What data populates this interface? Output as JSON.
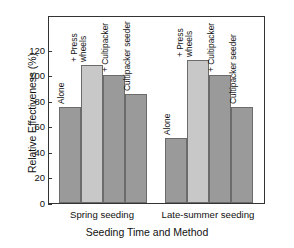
{
  "chart_data": {
    "type": "bar",
    "title": "",
    "xlabel": "Seeding Time and Method",
    "ylabel": "Relative Effectiveness (%)",
    "ylim": [
      0,
      147
    ],
    "yticks": [
      0,
      20,
      40,
      60,
      80,
      100,
      120
    ],
    "ytick_labels": [
      "0",
      "20",
      "40",
      "60",
      "80",
      "100",
      "120"
    ],
    "grid": false,
    "legend": "none",
    "categories": [
      "Spring seeding",
      "Late-summer seeding"
    ],
    "bar_labels": [
      "Alone",
      "+ Press wheels",
      "+ Cultipacker",
      "Cultipacker seeder"
    ],
    "groups": [
      {
        "name": "Spring seeding",
        "bars": [
          {
            "label": "Alone",
            "value": 75,
            "shade": "dark"
          },
          {
            "label": "+ Press wheels",
            "value": 108,
            "shade": "light"
          },
          {
            "label": "+ Cultipacker",
            "value": 100,
            "shade": "dark"
          },
          {
            "label": "Cultipacker seeder",
            "value": 85,
            "shade": "dark"
          }
        ]
      },
      {
        "name": "Late-summer seeding",
        "bars": [
          {
            "label": "Alone",
            "value": 51,
            "shade": "dark"
          },
          {
            "label": "+ Press wheels",
            "value": 112,
            "shade": "light"
          },
          {
            "label": "+ Cultipacker",
            "value": 100,
            "shade": "dark"
          },
          {
            "label": "Cultipacker seeder",
            "value": 75,
            "shade": "dark"
          }
        ]
      }
    ],
    "colors": {
      "bar_dark": "#9a9a9a",
      "bar_light": "#c8c8c8",
      "bar_edge": "#6b6b6b",
      "axis": "#333333",
      "text": "#111111",
      "background": "#ffffff"
    }
  }
}
